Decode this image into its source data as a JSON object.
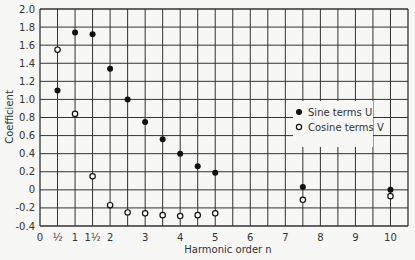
{
  "chart_data": {
    "type": "scatter",
    "title": "",
    "xlabel": "Harmonic order  n",
    "ylabel": "Coefficient",
    "xlim": [
      0,
      10.5
    ],
    "ylim": [
      -0.4,
      2.0
    ],
    "grid": true,
    "x_tick_labels": [
      {
        "x": 0,
        "label": "0"
      },
      {
        "x": 0.5,
        "label": "½"
      },
      {
        "x": 1,
        "label": "1"
      },
      {
        "x": 1.5,
        "label": "1½"
      },
      {
        "x": 2,
        "label": "2"
      },
      {
        "x": 3,
        "label": "3"
      },
      {
        "x": 4,
        "label": "4"
      },
      {
        "x": 5,
        "label": "5"
      },
      {
        "x": 6,
        "label": "6"
      },
      {
        "x": 7,
        "label": "7"
      },
      {
        "x": 8,
        "label": "8"
      },
      {
        "x": 9,
        "label": "9"
      },
      {
        "x": 10,
        "label": "10"
      }
    ],
    "y_ticks": [
      -0.4,
      -0.2,
      0,
      0.2,
      0.4,
      0.6,
      0.8,
      1.0,
      1.2,
      1.4,
      1.6,
      1.8,
      2.0
    ],
    "y_tick_labels": [
      "-0.4",
      "-0.2",
      "0",
      "0.2",
      "0.4",
      "0.6",
      "0.8",
      "1.0",
      "1.2",
      "1.4",
      "1.6",
      "1.8",
      "2.0"
    ],
    "legend_position": "right-middle",
    "series": [
      {
        "name": "Sine terms  U",
        "marker": "filled-circle",
        "x": [
          0.5,
          1,
          1.5,
          2,
          2.5,
          3,
          3.5,
          4,
          4.5,
          5,
          7.5,
          10
        ],
        "values": [
          1.1,
          1.74,
          1.72,
          1.34,
          1.0,
          0.75,
          0.56,
          0.4,
          0.26,
          0.19,
          0.03,
          0.0
        ]
      },
      {
        "name": "Cosine terms  V",
        "marker": "open-circle",
        "x": [
          0.5,
          1,
          1.5,
          2,
          2.5,
          3,
          3.5,
          4,
          4.5,
          5,
          7.5,
          10
        ],
        "values": [
          1.55,
          0.84,
          0.15,
          -0.17,
          -0.25,
          -0.26,
          -0.28,
          -0.29,
          -0.28,
          -0.26,
          -0.11,
          -0.07
        ]
      }
    ]
  }
}
